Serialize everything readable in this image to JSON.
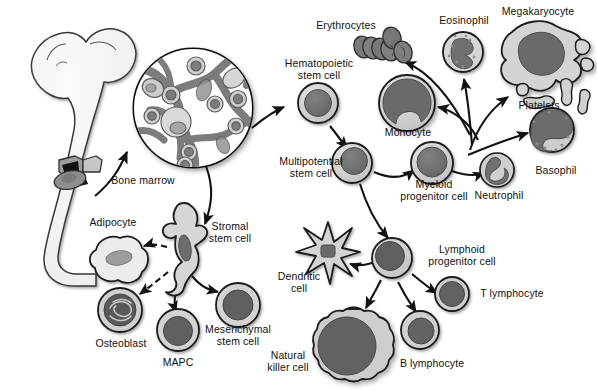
{
  "figure": {
    "title_visible": false,
    "type": "biology-diagram",
    "palette": {
      "background": "#ffffff",
      "outline": "#1a1a1a",
      "cytoplasm_light": "#d2d2d2",
      "cytoplasm_mid": "#b9b9b9",
      "nucleus_dark": "#6e6e6e",
      "nucleus_darker": "#5c5c5c",
      "erythrocyte": "#7d7d7d",
      "bone_fill": "#f2f2f2",
      "marrow_network": "#7e7e7e",
      "arrow": "#111111"
    }
  },
  "labels": {
    "bone_marrow": "Bone marrow",
    "hematopoietic_stem_cell": "Hematopoietic\nstem cell",
    "multipotential_stem_cell": "Multipotential\nstem cell",
    "erythrocytes": "Erythrocytes",
    "monocyte": "Monocyte",
    "eosinophil": "Eosinophil",
    "megakaryocyte": "Megakaryocyte",
    "platelets": "Platelets",
    "basophil": "Basophil",
    "neutrophil": "Neutrophil",
    "myeloid_progenitor_cell": "Myeloid\nprogenitor cell",
    "lymphoid_progenitor_cell": "Lymphoid\nprogenitor cell",
    "dendritic_cell": "Dendritic\ncell",
    "t_lymphocyte": "T lymphocyte",
    "b_lymphocyte": "B lymphocyte",
    "natural_killer_cell": "Natural\nkiller cell",
    "adipocyte": "Adipocyte",
    "stromal_stem_cell": "Stromal\nstem cell",
    "osteoblast": "Osteoblast",
    "mapc": "MAPC",
    "mesenchymal_stem_cell": "Mesenchymal\nstem cell"
  },
  "structures": [
    {
      "name": "femur-bone",
      "label": "Bone marrow",
      "note": "long bone with marrow cavity shown at distal end"
    },
    {
      "name": "marrow-micrograph",
      "label": "",
      "note": "circular magnified view of marrow trabecular network with scattered cells"
    }
  ],
  "cells": [
    {
      "name": "hematopoietic-stem-cell",
      "label": "Hematopoietic stem cell",
      "shape": "round",
      "x": 318,
      "y": 103,
      "r": 20
    },
    {
      "name": "multipotential-stem-cell",
      "label": "Multipotential stem cell",
      "shape": "round",
      "x": 352,
      "y": 163,
      "r": 20
    },
    {
      "name": "myeloid-progenitor-cell",
      "label": "Myeloid progenitor cell",
      "shape": "round",
      "x": 432,
      "y": 163,
      "r": 21
    },
    {
      "name": "lymphoid-progenitor-cell",
      "label": "Lymphoid progenitor cell",
      "shape": "round",
      "x": 392,
      "y": 258,
      "r": 20
    },
    {
      "name": "monocyte",
      "label": "Monocyte",
      "shape": "round-kidney-nucleus",
      "x": 407,
      "y": 103,
      "r": 28
    },
    {
      "name": "erythrocytes",
      "label": "Erythrocytes",
      "shape": "disc-cluster",
      "x": 383,
      "y": 48,
      "count": 6
    },
    {
      "name": "eosinophil",
      "label": "Eosinophil",
      "shape": "granular-bilobed",
      "x": 463,
      "y": 52,
      "r": 20
    },
    {
      "name": "megakaryocyte",
      "label": "Megakaryocyte",
      "shape": "lobulated-large",
      "x": 538,
      "y": 55,
      "r": 34
    },
    {
      "name": "platelets",
      "label": "Platelets",
      "shape": "small-fragments",
      "x": 540,
      "y": 100,
      "count": 3
    },
    {
      "name": "basophil",
      "label": "Basophil",
      "shape": "granular-round",
      "x": 552,
      "y": 130,
      "r": 22
    },
    {
      "name": "neutrophil",
      "label": "Neutrophil",
      "shape": "multilobed",
      "x": 497,
      "y": 170,
      "r": 17
    },
    {
      "name": "dendritic-cell",
      "label": "Dendritic cell",
      "shape": "star-spiky",
      "x": 328,
      "y": 250,
      "r": 30
    },
    {
      "name": "t-lymphocyte",
      "label": "T lymphocyte",
      "shape": "round-small",
      "x": 452,
      "y": 294,
      "r": 17
    },
    {
      "name": "b-lymphocyte",
      "label": "B lymphocyte",
      "shape": "round-small",
      "x": 420,
      "y": 330,
      "r": 19
    },
    {
      "name": "natural-killer-cell",
      "label": "Natural killer cell",
      "shape": "scalloped-large",
      "x": 347,
      "y": 345,
      "r": 36
    },
    {
      "name": "adipocyte",
      "label": "Adipocyte",
      "shape": "lobulated-pale",
      "x": 117,
      "y": 262,
      "r": 25
    },
    {
      "name": "stromal-stem-cell",
      "label": "Stromal stem cell",
      "shape": "spindle-fibroblastic",
      "x": 186,
      "y": 255,
      "r": 22
    },
    {
      "name": "osteoblast",
      "label": "Osteoblast",
      "shape": "round-coiled-nucleus",
      "x": 120,
      "y": 310,
      "r": 22
    },
    {
      "name": "mapc",
      "label": "MAPC",
      "shape": "round",
      "x": 178,
      "y": 330,
      "r": 21
    },
    {
      "name": "mesenchymal-stem-cell",
      "label": "Mesenchymal stem cell",
      "shape": "round",
      "x": 238,
      "y": 305,
      "r": 22
    }
  ],
  "arrows": [
    {
      "name": "bone-to-micrograph",
      "from": "femur-bone",
      "to": "marrow-micrograph",
      "style": "solid"
    },
    {
      "name": "micrograph-to-hsc",
      "from": "marrow-micrograph",
      "to": "hematopoietic-stem-cell",
      "style": "solid"
    },
    {
      "name": "micrograph-to-stromal",
      "from": "marrow-micrograph",
      "to": "stromal-stem-cell",
      "style": "solid"
    },
    {
      "name": "hsc-to-multipotential",
      "from": "hematopoietic-stem-cell",
      "to": "multipotential-stem-cell",
      "style": "solid"
    },
    {
      "name": "multipotential-to-myeloid",
      "from": "multipotential-stem-cell",
      "to": "myeloid-progenitor-cell",
      "style": "solid"
    },
    {
      "name": "multipotential-to-lymphoid",
      "from": "multipotential-stem-cell",
      "to": "lymphoid-progenitor-cell",
      "style": "solid"
    },
    {
      "name": "myeloid-to-erythrocytes",
      "from": "myeloid-progenitor-cell",
      "to": "erythrocytes",
      "style": "solid"
    },
    {
      "name": "myeloid-to-monocyte",
      "from": "myeloid-progenitor-cell",
      "to": "monocyte",
      "style": "solid"
    },
    {
      "name": "myeloid-to-eosinophil",
      "from": "myeloid-progenitor-cell",
      "to": "eosinophil",
      "style": "solid"
    },
    {
      "name": "myeloid-to-megakaryocyte",
      "from": "myeloid-progenitor-cell",
      "to": "megakaryocyte",
      "style": "solid"
    },
    {
      "name": "myeloid-to-basophil",
      "from": "myeloid-progenitor-cell",
      "to": "basophil",
      "style": "solid"
    },
    {
      "name": "myeloid-to-neutrophil",
      "from": "myeloid-progenitor-cell",
      "to": "neutrophil",
      "style": "solid"
    },
    {
      "name": "lymphoid-to-dendritic",
      "from": "lymphoid-progenitor-cell",
      "to": "dendritic-cell",
      "style": "solid"
    },
    {
      "name": "lymphoid-to-t-lymphocyte",
      "from": "lymphoid-progenitor-cell",
      "to": "t-lymphocyte",
      "style": "solid"
    },
    {
      "name": "lymphoid-to-b-lymphocyte",
      "from": "lymphoid-progenitor-cell",
      "to": "b-lymphocyte",
      "style": "solid"
    },
    {
      "name": "lymphoid-to-nk",
      "from": "lymphoid-progenitor-cell",
      "to": "natural-killer-cell",
      "style": "solid"
    },
    {
      "name": "stromal-to-adipocyte",
      "from": "stromal-stem-cell",
      "to": "adipocyte",
      "style": "dashed"
    },
    {
      "name": "stromal-to-osteoblast",
      "from": "stromal-stem-cell",
      "to": "osteoblast",
      "style": "dashed"
    },
    {
      "name": "stromal-to-mapc",
      "from": "stromal-stem-cell",
      "to": "mapc",
      "style": "solid"
    },
    {
      "name": "stromal-to-mesenchymal",
      "from": "stromal-stem-cell",
      "to": "mesenchymal-stem-cell",
      "style": "solid"
    }
  ]
}
